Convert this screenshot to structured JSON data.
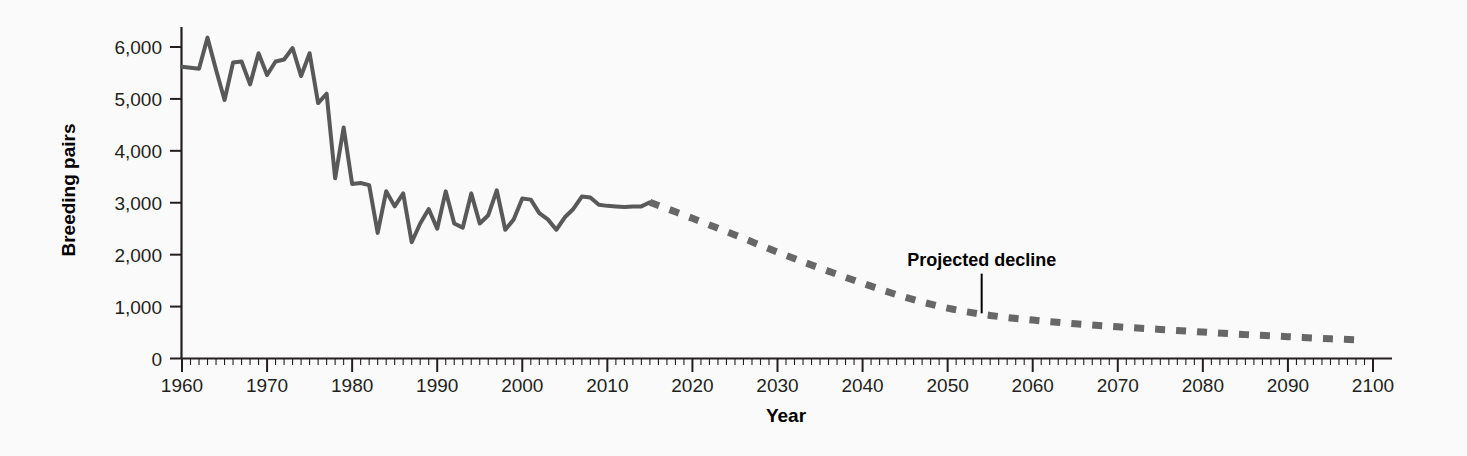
{
  "chart_data": {
    "type": "line",
    "title": "",
    "xlabel": "Year",
    "ylabel": "Breeding pairs",
    "xlim": [
      1960,
      2100
    ],
    "ylim": [
      0,
      6400
    ],
    "grid": false,
    "legend": "none",
    "x_ticks": [
      1960,
      1970,
      1980,
      1990,
      2000,
      2010,
      2020,
      2030,
      2040,
      2050,
      2060,
      2070,
      2080,
      2090,
      2100
    ],
    "x_tick_labels": [
      "1960",
      "1970",
      "1980",
      "1990",
      "2000",
      "2010",
      "2020",
      "2030",
      "2040",
      "2050",
      "2060",
      "2070",
      "2080",
      "2090",
      "2100"
    ],
    "x_minor_tick_step": 1,
    "y_ticks": [
      0,
      1000,
      2000,
      3000,
      4000,
      5000,
      6000
    ],
    "y_tick_labels": [
      "0",
      "1,000",
      "2,000",
      "3,000",
      "4,000",
      "5,000",
      "6,000"
    ],
    "line_color": "#595959",
    "line_width": 4,
    "axis_color": "#231f20",
    "background_color": "#fbfafa",
    "series": [
      {
        "name": "Observed breeding pairs",
        "style": "solid",
        "x": [
          1960,
          1961,
          1962,
          1963,
          1964,
          1965,
          1966,
          1967,
          1968,
          1969,
          1970,
          1971,
          1972,
          1973,
          1974,
          1975,
          1976,
          1977,
          1978,
          1979,
          1980,
          1981,
          1982,
          1983,
          1984,
          1985,
          1986,
          1987,
          1988,
          1989,
          1990,
          1991,
          1992,
          1993,
          1994,
          1995,
          1996,
          1997,
          1998,
          1999,
          2000,
          2001,
          2002,
          2003,
          2004,
          2005,
          2006,
          2007,
          2008,
          2009,
          2010,
          2011,
          2012,
          2013,
          2014,
          2015
        ],
        "values": [
          5620,
          5600,
          5580,
          6180,
          5560,
          4980,
          5700,
          5720,
          5280,
          5880,
          5460,
          5720,
          5760,
          5980,
          5440,
          5880,
          4920,
          5100,
          3470,
          4450,
          3360,
          3380,
          3340,
          2420,
          3220,
          2930,
          3180,
          2240,
          2600,
          2880,
          2500,
          3220,
          2600,
          2520,
          3180,
          2600,
          2760,
          3240,
          2480,
          2680,
          3080,
          3060,
          2800,
          2680,
          2480,
          2720,
          2880,
          3120,
          3100,
          2960,
          2940,
          2930,
          2920,
          2930,
          2930,
          3010
        ]
      },
      {
        "name": "Projected decline",
        "style": "dashed",
        "x": [
          2015,
          2020,
          2025,
          2030,
          2035,
          2040,
          2045,
          2050,
          2055,
          2060,
          2065,
          2070,
          2075,
          2080,
          2085,
          2090,
          2095,
          2098
        ],
        "values": [
          3010,
          2700,
          2380,
          2050,
          1740,
          1450,
          1180,
          970,
          830,
          740,
          670,
          610,
          560,
          510,
          460,
          420,
          380,
          360
        ]
      }
    ],
    "annotations": [
      {
        "text": "Projected decline",
        "x": 2054,
        "y": 1480,
        "pointer_to_x": 2054,
        "pointer_to_y": 870
      }
    ]
  }
}
